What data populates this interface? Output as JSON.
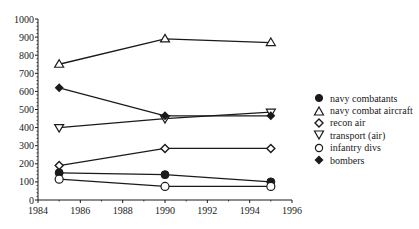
{
  "chart_data": {
    "type": "line",
    "title": "",
    "xlabel": "",
    "ylabel": "",
    "xlim": [
      1984,
      1996
    ],
    "ylim": [
      0,
      1000
    ],
    "x_ticks": [
      1984,
      1986,
      1988,
      1990,
      1992,
      1994,
      1996
    ],
    "y_ticks": [
      0,
      100,
      200,
      300,
      400,
      500,
      600,
      700,
      800,
      900,
      1000
    ],
    "grid": false,
    "legend_position": "right",
    "x": [
      1985,
      1990,
      1995
    ],
    "series": [
      {
        "name": "navy combatants",
        "marker": "filled-circle",
        "values": [
          150,
          140,
          100
        ]
      },
      {
        "name": "navy combat aircraft",
        "marker": "open-triangle-up",
        "values": [
          750,
          890,
          870
        ]
      },
      {
        "name": "recon air",
        "marker": "open-diamond",
        "values": [
          190,
          285,
          285
        ]
      },
      {
        "name": "transport (air)",
        "marker": "open-triangle-down",
        "values": [
          400,
          450,
          485
        ]
      },
      {
        "name": "infantry divs",
        "marker": "open-circle",
        "values": [
          115,
          75,
          75
        ]
      },
      {
        "name": "bombers",
        "marker": "filled-diamond",
        "values": [
          620,
          465,
          465
        ]
      }
    ]
  },
  "legend": {
    "items": [
      {
        "label": "navy combatants"
      },
      {
        "label": "navy combat aircraft"
      },
      {
        "label": "recon air"
      },
      {
        "label": "transport (air)"
      },
      {
        "label": "infantry divs"
      },
      {
        "label": "bombers"
      }
    ]
  },
  "colors": {
    "ink": "#1a1a1a",
    "background": "#ffffff"
  }
}
